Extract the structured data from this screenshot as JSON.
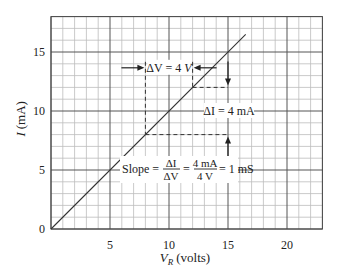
{
  "chart_data": {
    "type": "line",
    "title": "",
    "xlabel": "V_R (volts)",
    "xlabel_main": "V",
    "xlabel_sub": "R",
    "xlabel_unit": "(volts)",
    "ylabel": "I (mA)",
    "ylabel_main": "I",
    "ylabel_unit": "(mA)",
    "xlim": [
      0,
      23
    ],
    "ylim": [
      0,
      18
    ],
    "x_ticks": [
      0,
      5,
      10,
      15,
      20
    ],
    "x_tick_labels": [
      "",
      "5",
      "10",
      "15",
      "20"
    ],
    "y_ticks": [
      0,
      5,
      10,
      15
    ],
    "y_tick_labels": [
      "0",
      "5",
      "10",
      "15"
    ],
    "grid": {
      "on": true,
      "minor_step": 1,
      "major_step": 5
    },
    "series": [
      {
        "name": "I vs V_R",
        "x": [
          0,
          16.5
        ],
        "y": [
          0,
          16.5
        ],
        "color": "#333333"
      }
    ],
    "annotations": {
      "delta_v": {
        "label_prefix": "ΔV = 4 ",
        "label_unit": "V",
        "x1": 8,
        "x2": 12,
        "y": 14
      },
      "delta_i": {
        "label": "ΔI = 4 mA",
        "x": 15,
        "y1": 8,
        "y2": 12
      },
      "slope": {
        "label_slope": "Slope =",
        "frac1_num": "ΔI",
        "frac1_den": "ΔV",
        "frac2_num": "4 mA",
        "frac2_den": "4 V",
        "result": "= 1 mS",
        "value_mS": 1
      }
    },
    "colors": {
      "grid_minor": "#bdbdbd",
      "grid_major": "#555555",
      "line": "#333333",
      "text": "#222222"
    }
  }
}
